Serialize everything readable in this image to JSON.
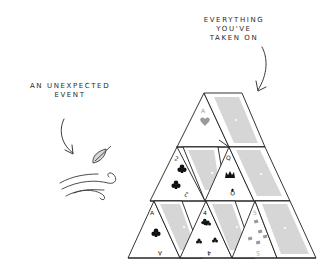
{
  "labels": {
    "everything": [
      "EVERYTHING",
      "YOU'VE",
      "TAKEN ON"
    ],
    "event": [
      "AN UNEXPECTED",
      "EVENT"
    ]
  },
  "cards": [
    {
      "row": 1,
      "rank": "A",
      "suit": "heart",
      "color": "gray"
    },
    {
      "row": 2,
      "rank": "2",
      "suit": "club",
      "color": "black"
    },
    {
      "row": 2,
      "rank": "Q",
      "suit": "crown",
      "color": "black"
    },
    {
      "row": 3,
      "rank": "A",
      "suit": "club",
      "color": "black"
    },
    {
      "row": 3,
      "rank": "4",
      "suit": "club",
      "color": "black"
    },
    {
      "row": 3,
      "rank": "5",
      "suit": "diamond",
      "color": "gray"
    }
  ],
  "colors": {
    "ink": "#1e1e1e",
    "card_back": "#d6d6d6",
    "card_back_inner": "#c9c9c9",
    "gray_suit": "#9a9a9a",
    "background": "#ffffff"
  },
  "icons": [
    "arrow-down-icon",
    "leaf-icon",
    "wind-gust-icon",
    "card-back-icon"
  ]
}
